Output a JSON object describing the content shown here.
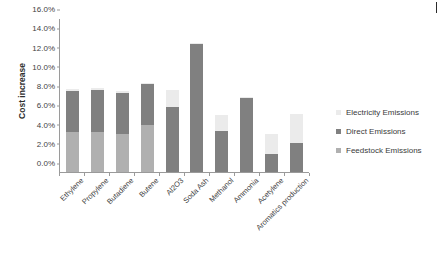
{
  "chart_data": {
    "type": "bar",
    "subtype": "stacked-column",
    "title": "",
    "xlabel": "",
    "ylabel": "Cost increase",
    "ylim": [
      0,
      16
    ],
    "ytick_values": [
      0,
      2,
      4,
      6,
      8,
      10,
      12,
      14,
      16
    ],
    "ytick_labels": [
      "0.0%",
      "2.0%",
      "4.0%",
      "6.0%",
      "8.0%",
      "10.0%",
      "12.0%",
      "14.0%",
      "16.0%"
    ],
    "grid": false,
    "legend_position": "right",
    "categories": [
      "Ethylene",
      "Propylene",
      "Butadiene",
      "Butene",
      "Al2O3",
      "Soda Ash",
      "Methanol",
      "Ammonia",
      "Acetylene",
      "Aromatics production"
    ],
    "series": [
      {
        "name": "Feedstock Emissions",
        "color": "#b0b0b0",
        "values": [
          4.15,
          4.2,
          3.9,
          4.85,
          0,
          0,
          0,
          0,
          0,
          0
        ]
      },
      {
        "name": "Direct Emissions",
        "color": "#808080",
        "values": [
          4.25,
          4.3,
          4.35,
          4.3,
          6.75,
          13.3,
          4.3,
          7.7,
          1.9,
          3.05
        ]
      },
      {
        "name": "Electricity Emissions",
        "color": "#ebebeb",
        "values": [
          0.2,
          0.2,
          0.15,
          0.15,
          1.75,
          0.15,
          1.6,
          0.1,
          2.1,
          2.95
        ]
      }
    ],
    "totals": [
      8.6,
      8.7,
      8.4,
      9.3,
      8.5,
      13.45,
      5.9,
      7.8,
      4.0,
      6.0
    ]
  },
  "legend": {
    "items": [
      {
        "label": "Electricity Emissions",
        "color": "#ebebeb"
      },
      {
        "label": "Direct Emissions",
        "color": "#808080"
      },
      {
        "label": "Feedstock Emissions",
        "color": "#b0b0b0"
      }
    ]
  },
  "axes": {
    "y_title": "Cost increase"
  }
}
